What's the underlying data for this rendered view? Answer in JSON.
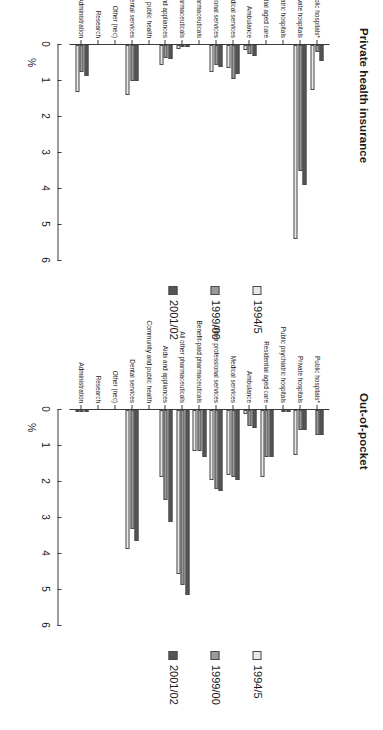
{
  "figure": {
    "axis_label": "%",
    "tick_labels": [
      "0",
      "1",
      "2",
      "3",
      "4",
      "5",
      "6"
    ],
    "series_colors": {
      "1994/5": "#e8e8e8",
      "1999/00": "#9a9a9a",
      "2001/02": "#555555"
    },
    "legend": [
      {
        "label": "1994/5",
        "swatch": "s0"
      },
      {
        "label": "1999/00",
        "swatch": "s1"
      },
      {
        "label": "2001/02",
        "swatch": "s2"
      }
    ]
  },
  "chart_data": [
    {
      "type": "bar",
      "title": "Private health insurance",
      "orientation": "horizontal",
      "xlabel": "",
      "ylabel": "%",
      "xlim": [
        0,
        6
      ],
      "grid": false,
      "legend_position": "right",
      "categories": [
        "Public hospitals*",
        "Private hospitals",
        "Public psychiatric hospitals",
        "Residential aged care",
        "Ambulance",
        "Medical services",
        "Other professional services",
        "Benefit-paid pharmaceuticals",
        "All other pharmaceuticals",
        "Aids and appliances",
        "Community and public health",
        "Dental services",
        "Other (nec)",
        "Research",
        "Administration"
      ],
      "series": [
        {
          "name": "1994/5",
          "values": [
            1.25,
            5.4,
            0.0,
            0.0,
            0.15,
            0.65,
            0.75,
            0.0,
            0.1,
            0.55,
            0.0,
            1.4,
            0.0,
            0.0,
            1.3
          ]
        },
        {
          "name": "1999/00",
          "values": [
            0.2,
            3.5,
            0.0,
            0.0,
            0.25,
            0.95,
            0.55,
            0.0,
            0.05,
            0.35,
            0.0,
            1.0,
            0.0,
            0.0,
            0.75
          ]
        },
        {
          "name": "2001/02",
          "values": [
            0.45,
            3.9,
            0.0,
            0.0,
            0.3,
            0.8,
            0.6,
            0.0,
            0.05,
            0.4,
            0.0,
            1.0,
            0.0,
            0.0,
            0.85
          ]
        }
      ]
    },
    {
      "type": "bar",
      "title": "Out-of-pocket",
      "orientation": "horizontal",
      "xlabel": "",
      "ylabel": "%",
      "xlim": [
        0,
        6
      ],
      "grid": false,
      "legend_position": "right",
      "categories": [
        "Public hospitals*",
        "Private hospitals",
        "Public psychiatric hospitals",
        "Residential aged care",
        "Ambulance",
        "Medical services",
        "Other professional services",
        "Benefit-paid pharmaceuticals",
        "All other pharmaceuticals",
        "Aids and appliances",
        "Community and public health",
        "Dental services",
        "Other (nec)",
        "Research",
        "Administration"
      ],
      "series": [
        {
          "name": "1994/5",
          "values": [
            0.0,
            1.25,
            0.0,
            1.85,
            0.1,
            1.8,
            1.95,
            1.15,
            4.55,
            1.85,
            0.0,
            3.85,
            0.0,
            0.0,
            0.05
          ]
        },
        {
          "name": "1999/00",
          "values": [
            0.7,
            0.55,
            0.05,
            1.3,
            0.45,
            1.85,
            2.2,
            1.15,
            4.85,
            2.5,
            0.0,
            3.3,
            0.0,
            0.0,
            0.05
          ]
        },
        {
          "name": "2001/02",
          "values": [
            0.7,
            0.55,
            0.05,
            1.3,
            0.5,
            1.95,
            2.25,
            1.3,
            5.15,
            3.1,
            0.0,
            3.65,
            0.0,
            0.0,
            0.05
          ]
        }
      ]
    }
  ]
}
